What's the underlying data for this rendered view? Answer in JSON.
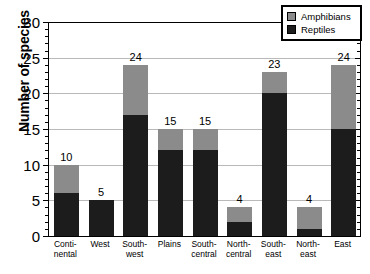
{
  "chart_data": {
    "type": "bar",
    "stacked": true,
    "title": "",
    "xlabel": "",
    "ylabel": "Number of species",
    "ylim": [
      0,
      30
    ],
    "ytick_step": 5,
    "yticks": [
      0,
      5,
      10,
      15,
      20,
      25,
      30
    ],
    "ytick_labels": [
      "0",
      "5",
      "10",
      "15",
      "20",
      "25",
      "30"
    ],
    "minor_tick_step": 1,
    "grid": true,
    "grid_axis": "y",
    "legend_position": "top-right",
    "categories": [
      "Conti-nental",
      "West",
      "South-west",
      "Plains",
      "South-central",
      "North-central",
      "South-east",
      "North-east",
      "East"
    ],
    "category_lines": [
      [
        "Conti-",
        "nental"
      ],
      [
        "West",
        ""
      ],
      [
        "South-",
        "west"
      ],
      [
        "Plains",
        ""
      ],
      [
        "South-",
        "central"
      ],
      [
        "North-",
        "central"
      ],
      [
        "South-",
        "east"
      ],
      [
        "North-",
        "east"
      ],
      [
        "East",
        ""
      ]
    ],
    "series": [
      {
        "name": "Reptiles",
        "color": "#1c1c1c",
        "values": [
          6,
          5,
          17,
          12,
          12,
          2,
          20,
          1,
          15
        ]
      },
      {
        "name": "Amphibians",
        "color": "#8b8b8b",
        "values": [
          4,
          0,
          7,
          3,
          3,
          2,
          3,
          3,
          9
        ]
      }
    ],
    "totals": [
      10,
      5,
      24,
      15,
      15,
      4,
      23,
      4,
      24
    ],
    "total_labels": [
      "10",
      "5",
      "24",
      "15",
      "15",
      "4",
      "23",
      "4",
      "24"
    ]
  },
  "legend": {
    "items": [
      {
        "label": "Amphibians",
        "color": "#8b8b8b"
      },
      {
        "label": "Reptiles",
        "color": "#1c1c1c"
      }
    ]
  }
}
